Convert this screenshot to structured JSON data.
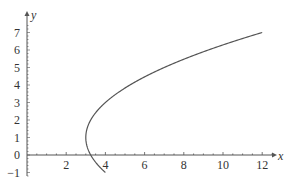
{
  "chart_data": {
    "type": "line",
    "title": "",
    "xlabel": "x",
    "ylabel": "y",
    "xlim": [
      0,
      13
    ],
    "ylim": [
      -1,
      7.6
    ],
    "grid": false,
    "legend": null,
    "x_ticks": [
      2,
      4,
      6,
      8,
      10,
      12
    ],
    "x_tick_labels": [
      "2",
      "4",
      "6",
      "8",
      "10",
      "12"
    ],
    "y_ticks": [
      -1,
      0,
      1,
      2,
      3,
      4,
      5,
      6,
      7
    ],
    "y_tick_labels": [
      "−1",
      "0",
      "1",
      "2",
      "3",
      "4",
      "5",
      "6",
      "7"
    ],
    "series": [
      {
        "name": "curve",
        "description": "sideways parabola (y-1)^2 = 4(x-3), vertex at (3,1), from y=-1 to y=7",
        "color": "#555555",
        "x": [
          4.0,
          3.5625,
          3.25,
          3.0625,
          3.0,
          3.0625,
          3.25,
          3.5625,
          4.0,
          4.5625,
          5.25,
          6.0625,
          7.0,
          8.0625,
          9.25,
          10.5625,
          12.0
        ],
        "y": [
          -1.0,
          -0.5,
          0.0,
          0.5,
          1.0,
          1.5,
          2.0,
          2.5,
          3.0,
          3.5,
          4.0,
          4.5,
          5.0,
          5.5,
          6.0,
          6.5,
          7.0
        ]
      }
    ]
  },
  "axes": {
    "x_label": "x",
    "y_label": "y"
  }
}
